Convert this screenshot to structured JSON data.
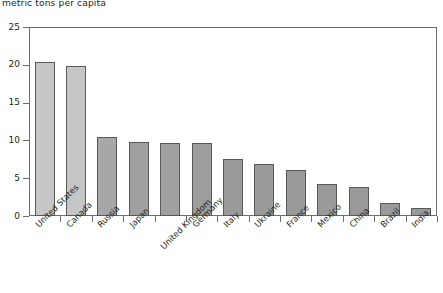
{
  "chart_data": {
    "type": "bar",
    "title": "metric tons per capita",
    "xlabel": "",
    "ylabel": "",
    "ylim": [
      0,
      25
    ],
    "yticks": [
      0,
      5,
      10,
      15,
      20,
      25
    ],
    "grid": false,
    "legend": "none",
    "categories": [
      "United States",
      "Canada",
      "Russia",
      "Japan",
      "United Kingdom",
      "Germany",
      "Italy",
      "Ukraine",
      "France",
      "Mexico",
      "China",
      "Brazil",
      "India"
    ],
    "values": [
      20.4,
      19.9,
      10.4,
      9.8,
      9.7,
      9.7,
      7.6,
      6.9,
      6.1,
      4.2,
      3.8,
      1.7,
      1.1
    ],
    "bar_colors": [
      "#c6c6c6",
      "#c6c6c6",
      "#a7a7a7",
      "#a0a0a0",
      "#a0a0a0",
      "#9d9d9d",
      "#9a9a9a",
      "#9a9a9a",
      "#9a9a9a",
      "#9a9a9a",
      "#9a9a9a",
      "#9a9a9a",
      "#9a9a9a"
    ],
    "bar_border_color": "#58595b",
    "axis_color": "#6d6e71",
    "text_color": "#231f20",
    "background": "#ffffff"
  },
  "axis": {
    "y_tick_labels": [
      "25",
      "20",
      "15",
      "10",
      "5",
      "0"
    ]
  }
}
